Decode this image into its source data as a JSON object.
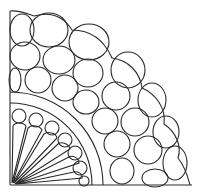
{
  "figure": {
    "title": "",
    "stroke_color": "#2a2a2a",
    "background": "#ffffff",
    "origin": [
      10,
      185
    ],
    "inner_ring_radii": [
      82,
      93
    ],
    "outer_radius_approx": 178
  }
}
